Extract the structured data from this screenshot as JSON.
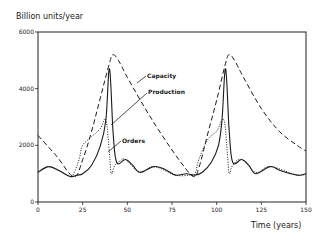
{
  "chart_data": {
    "type": "line",
    "title": "",
    "xlabel": "Time (years)",
    "ylabel": "Billion units/year",
    "xlim": [
      0,
      150
    ],
    "ylim": [
      0,
      6000
    ],
    "xticks": [
      0,
      25,
      50,
      75,
      100,
      125,
      150
    ],
    "yticks": [
      0,
      2000,
      4000,
      6000
    ],
    "grid": false,
    "legend": "inline annotations",
    "series": [
      {
        "name": "Capacity",
        "style": "dashed",
        "x": [
          0,
          10,
          20,
          25,
          30,
          35,
          40,
          42,
          45,
          50,
          60,
          70,
          80,
          87,
          90,
          95,
          100,
          105,
          107,
          110,
          115,
          125,
          135,
          145,
          150
        ],
        "y": [
          2350,
          1650,
          900,
          1500,
          2500,
          3700,
          4900,
          5200,
          5000,
          4400,
          3300,
          2300,
          1400,
          900,
          1200,
          2400,
          3600,
          4900,
          5200,
          5000,
          4400,
          3300,
          2500,
          2000,
          1800
        ]
      },
      {
        "name": "Production",
        "style": "solid",
        "x": [
          0,
          6,
          12,
          18,
          22,
          25,
          30,
          35,
          38,
          40,
          42,
          44,
          49,
          53,
          57,
          65,
          71,
          77,
          83,
          88,
          92,
          97,
          101,
          103,
          105,
          107,
          109,
          114,
          118,
          122,
          130,
          136,
          145,
          150
        ],
        "y": [
          1050,
          1250,
          1100,
          900,
          950,
          1000,
          1300,
          2000,
          2900,
          4700,
          2500,
          1400,
          1500,
          1300,
          1050,
          1250,
          1150,
          950,
          1000,
          950,
          1050,
          1400,
          2000,
          2900,
          4700,
          2500,
          1400,
          1500,
          1300,
          1000,
          1250,
          1100,
          950,
          1000
        ]
      },
      {
        "name": "Orders",
        "style": "dotted",
        "x": [
          0,
          6,
          12,
          18,
          20,
          23,
          25,
          30,
          35,
          38,
          40,
          41,
          43,
          46,
          49,
          57,
          65,
          77,
          85,
          88,
          90,
          95,
          100,
          104,
          106,
          107,
          109,
          114,
          122,
          130,
          145,
          150
        ],
        "y": [
          1050,
          1250,
          1100,
          900,
          1000,
          1500,
          2000,
          2300,
          2600,
          2900,
          1700,
          1000,
          1300,
          1450,
          1500,
          1050,
          1250,
          950,
          950,
          1000,
          1500,
          2200,
          2500,
          2900,
          1700,
          1000,
          1300,
          1500,
          1050,
          1250,
          950,
          1000
        ]
      }
    ],
    "annotations": [
      {
        "text": "Capacity",
        "x": 55,
        "y": 4300
      },
      {
        "text": "Production",
        "x": 64,
        "y": 3850
      },
      {
        "text": "Orders",
        "x": 47,
        "y": 2100
      }
    ]
  },
  "labels": {
    "ylabel": "Billion units/year",
    "xlabel": "Time (years)",
    "capacity": "Capacity",
    "production": "Production",
    "orders": "Orders"
  }
}
